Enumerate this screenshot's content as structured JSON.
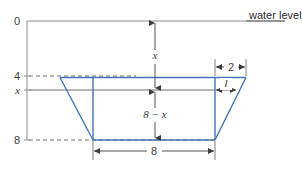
{
  "figure": {
    "kind": "trough-cross-section-diagram",
    "background_color": "#ffffff",
    "annotation": {
      "water_level_label": "water level"
    },
    "axis": {
      "name": "depth-axis",
      "orientation": "vertical",
      "color": "#8c8c8c",
      "ticks": [
        {
          "label": "0",
          "value": 0
        },
        {
          "label": "4",
          "value": 4
        },
        {
          "label": "x",
          "value": null
        },
        {
          "label": "8",
          "value": 8
        }
      ]
    },
    "dimensions": [
      {
        "name": "depth-to-water-surface",
        "label": "x",
        "orientation": "vertical"
      },
      {
        "name": "remaining-depth",
        "label": "8 − x",
        "orientation": "vertical"
      },
      {
        "name": "top-overhang-width",
        "label": "2",
        "orientation": "horizontal"
      },
      {
        "name": "bottom-width",
        "label": "8",
        "orientation": "horizontal"
      },
      {
        "name": "slant-offset-at-x",
        "label": "l",
        "orientation": "horizontal"
      }
    ],
    "shape": {
      "name": "trapezoid-trough",
      "stroke_color": "#4472b8",
      "inner_line_color": "#4472b8",
      "top_width": 12,
      "bottom_width": 8,
      "depth": 4,
      "top_depth_mark": 4,
      "bottom_depth_mark": 8
    },
    "guides": {
      "dashed_color": "#6f6f6f",
      "solid_color": "#6f6f6f"
    }
  }
}
